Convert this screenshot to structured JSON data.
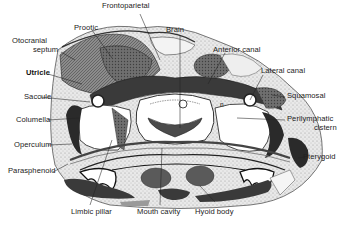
{
  "figure": {
    "type": "anatomical cross-section diagram",
    "colors": {
      "background": "#ffffff",
      "ink": "#222222",
      "dark_tissue": "#2b2b2b",
      "mid_tissue": "#6a6a6a",
      "light_stipple": "#c9c9c9"
    }
  },
  "labels": {
    "frontoparietal": "Frontoparietal",
    "prootic": "Prootic",
    "brain": "Brain",
    "otocranial_septum_1": "Otocranial",
    "otocranial_septum_2": "septum",
    "anterior_canal": "Anterior canal",
    "lateral_canal": "Lateral canal",
    "utricle": "Utricle",
    "squamosal": "Squamosal",
    "saccule": "Saccule",
    "perilymphatic_cistern_1": "Perilymphatic",
    "perilymphatic_cistern_2": "cistern",
    "columella": "Columella",
    "operculum": "Operculum",
    "pterygoid": "Pterygoid",
    "parasphenoid": "Parasphenoid",
    "limbic_pillar": "Limbic pillar",
    "mouth_cavity": "Mouth cavity",
    "hyoid_body": "Hyoid body",
    "n_marker": "n"
  }
}
